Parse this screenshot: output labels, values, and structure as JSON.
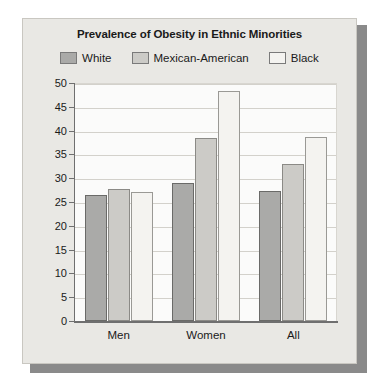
{
  "chart_data": {
    "type": "bar",
    "title": "Prevalence of Obesity in Ethnic Minorities",
    "xlabel": "",
    "ylabel": "",
    "categories": [
      "Men",
      "Women",
      "All"
    ],
    "series": [
      {
        "name": "White",
        "values": [
          26.4,
          28.9,
          27.4
        ],
        "color": "#aaaaa8"
      },
      {
        "name": "Mexican-American",
        "values": [
          27.8,
          38.4,
          33.0
        ],
        "color": "#cccbc7"
      },
      {
        "name": "Black",
        "values": [
          27.0,
          48.3,
          38.7
        ],
        "color": "#f4f3f0"
      }
    ],
    "ylim": [
      0,
      50
    ],
    "yticks": [
      0,
      5,
      10,
      15,
      20,
      25,
      30,
      35,
      40,
      45,
      50
    ],
    "ytick_labels": [
      "0",
      "5",
      "10",
      "15",
      "20",
      "25",
      "30",
      "35",
      "40",
      "45",
      "50"
    ],
    "grid": true,
    "legend_position": "top"
  },
  "figure": {
    "background_color": "#e9e8e4",
    "plot_background_color": "#fbfbfa",
    "axis_color": "#6f6f6f",
    "gridline_color": "#d3d1cb"
  }
}
